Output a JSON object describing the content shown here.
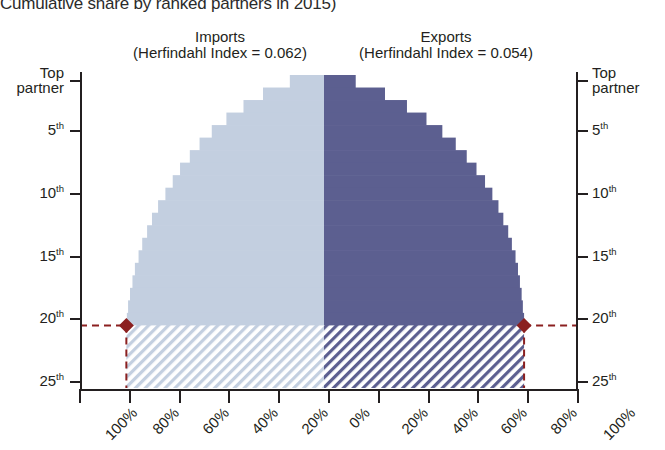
{
  "title": "Cumulative share by ranked partners in 2015)",
  "panels": {
    "imports": {
      "name": "Imports",
      "index_label": "(Herfindahl Index = 0.062)"
    },
    "exports": {
      "name": "Exports",
      "index_label": "(Herfindahl Index = 0.054)"
    }
  },
  "axes": {
    "y_left_ticks": [
      "Top partner",
      "5th",
      "10th",
      "15th",
      "20th",
      "25th"
    ],
    "y_right_ticks": [
      "Top partner",
      "5th",
      "10th",
      "15th",
      "20th",
      "25th"
    ],
    "x_ticks": [
      "100%",
      "80%",
      "60%",
      "40%",
      "20%",
      "0%",
      "20%",
      "40%",
      "60%",
      "80%",
      "100%"
    ]
  },
  "colors": {
    "imports": "#c3cfe0",
    "exports": "#5c5f90",
    "marker": "#8b2020",
    "axis": "#231f20",
    "background": "#ffffff"
  },
  "marker": {
    "rank": 21,
    "imports_share": 81,
    "exports_share": 82,
    "style": "diamond"
  },
  "chart_data": {
    "type": "bar",
    "title": "Cumulative share by ranked partners in 2015)",
    "orientation": "horizontal-mirrored",
    "xlabel": "",
    "ylabel": "",
    "xlim": [
      0,
      100
    ],
    "ylim": [
      1,
      25
    ],
    "grid": false,
    "legend": "above-panels",
    "categories": [
      1,
      2,
      3,
      4,
      5,
      6,
      7,
      8,
      9,
      10,
      11,
      12,
      13,
      14,
      15,
      16,
      17,
      18,
      19,
      20,
      21,
      22,
      23,
      24,
      25
    ],
    "category_labels": [
      "Top partner",
      "2nd",
      "3rd",
      "4th",
      "5th",
      "6th",
      "7th",
      "8th",
      "9th",
      "10th",
      "11th",
      "12th",
      "13th",
      "14th",
      "15th",
      "16th",
      "17th",
      "18th",
      "19th",
      "20th",
      "21st",
      "22nd",
      "23rd",
      "24th",
      "25th"
    ],
    "series": [
      {
        "name": "Imports",
        "index_label": "(Herfindahl Index = 0.062)",
        "color": "#c3cfe0",
        "direction": "left",
        "values": [
          14,
          25,
          33,
          40,
          46,
          51,
          55,
          59,
          62,
          65,
          68,
          70.5,
          72.5,
          74.5,
          76,
          77.5,
          78.5,
          79.5,
          80.3,
          80.8,
          81,
          81,
          81,
          81,
          81
        ],
        "hatched_from_rank": 21
      },
      {
        "name": "Exports",
        "index_label": "(Herfindahl Index = 0.054)",
        "color": "#5c5f90",
        "direction": "right",
        "values": [
          13,
          25,
          34,
          42,
          48.5,
          54,
          58.5,
          62.5,
          66,
          69,
          71.5,
          73.5,
          75.5,
          77,
          78.5,
          79.5,
          80.3,
          81,
          81.5,
          82,
          82,
          82,
          82,
          82,
          82
        ],
        "hatched_from_rank": 21
      }
    ],
    "annotations": [
      {
        "type": "marker",
        "series": "Imports",
        "rank": 21,
        "value": 81,
        "shape": "diamond",
        "color": "#8b2020"
      },
      {
        "type": "marker",
        "series": "Exports",
        "rank": 21,
        "value": 82,
        "shape": "diamond",
        "color": "#8b2020"
      },
      {
        "type": "dashed-line",
        "orientation": "horizontal",
        "rank": 21,
        "color": "#8b2020"
      },
      {
        "type": "dashed-line",
        "orientation": "vertical",
        "series": "Imports",
        "value": 81,
        "color": "#8b2020"
      },
      {
        "type": "dashed-line",
        "orientation": "vertical",
        "series": "Exports",
        "value": 82,
        "color": "#8b2020"
      }
    ]
  }
}
